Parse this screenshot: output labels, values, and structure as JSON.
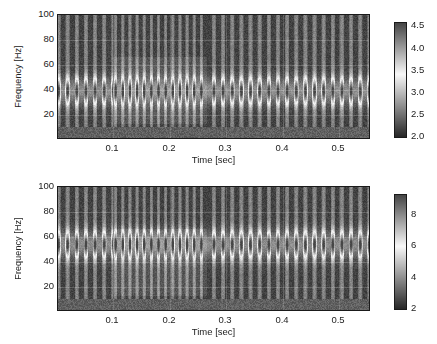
{
  "figure": {
    "type": "two-panel-spectrogram",
    "width": 437,
    "height": 344,
    "background": "#ffffff"
  },
  "chart_data": [
    {
      "type": "heatmap",
      "subtype": "spectrogram",
      "panel": "top",
      "title": "",
      "xlabel": "Time [sec]",
      "ylabel": "Frequency [Hz]",
      "xlim": [
        0.0,
        0.565
      ],
      "ylim": [
        10,
        102
      ],
      "xticks": [
        0.1,
        0.2,
        0.3,
        0.4,
        0.5
      ],
      "xticklabels": [
        "0.1",
        "0.2",
        "0.3",
        "0.4",
        "0.5"
      ],
      "yticks": [
        20,
        40,
        60,
        80,
        100
      ],
      "yticklabels": [
        "20",
        "40",
        "60",
        "80",
        "100"
      ],
      "grid": true,
      "colormap": "gray-nonmonotonic",
      "colorbar": {
        "vmin": 2.0,
        "vmax": 4.75,
        "ticks": [
          2.0,
          2.5,
          3.0,
          3.5,
          4.0,
          4.5
        ],
        "ticklabels": [
          "2.0",
          "2.5",
          "3.0",
          "3.5",
          "4.0",
          "4.5"
        ],
        "position": "right"
      },
      "features": {
        "pulse_stripe_count": 60,
        "formant_band_hz": [
          38,
          52
        ],
        "noise_floor_below_hz": 18,
        "dense_segment_sec": [
          0.1,
          0.27
        ],
        "dense_segment_band_hz": [
          20,
          71
        ]
      }
    },
    {
      "type": "heatmap",
      "subtype": "spectrogram",
      "panel": "bottom",
      "title": "",
      "xlabel": "Time [sec]",
      "ylabel": "Frequency [Hz]",
      "xlim": [
        0.0,
        0.565
      ],
      "ylim": [
        10,
        102
      ],
      "xticks": [
        0.1,
        0.2,
        0.3,
        0.4,
        0.5
      ],
      "xticklabels": [
        "0.1",
        "0.2",
        "0.3",
        "0.4",
        "0.5"
      ],
      "yticks": [
        20,
        40,
        60,
        80,
        100
      ],
      "yticklabels": [
        "20",
        "40",
        "60",
        "80",
        "100"
      ],
      "grid": true,
      "colormap": "gray-nonmonotonic",
      "colorbar": {
        "vmin": 1.6,
        "vmax": 9.2,
        "ticks": [
          2,
          4,
          6,
          8
        ],
        "ticklabels": [
          "2",
          "4",
          "6",
          "8"
        ],
        "position": "right"
      },
      "features": {
        "pulse_stripe_count": 60,
        "formant_band_hz": [
          52,
          66
        ],
        "noise_floor_below_hz": 18,
        "dense_segment_sec": [
          0.1,
          0.27
        ],
        "dense_segment_band_hz": [
          20,
          71
        ]
      }
    }
  ]
}
